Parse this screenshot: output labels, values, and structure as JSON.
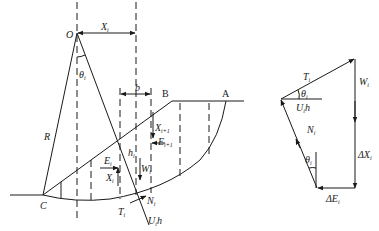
{
  "figure": {
    "left": {
      "points": {
        "O": "O",
        "A": "A",
        "B": "B",
        "C": "C"
      },
      "labels": {
        "R": "R",
        "Xi": "X",
        "Xi_sub": "i",
        "theta": "θ",
        "theta_sub": "i",
        "b": "b",
        "Ei": "E",
        "Ei_sub": "i",
        "XiSlice": "X",
        "XiSlice_sub": "i",
        "Xi1": "X",
        "Xi1_sub": "i+1",
        "Ei1": "E",
        "Ei1_sub": "i+1",
        "hi": "h",
        "hi_sub": "i",
        "W": "W",
        "W_sub": "i",
        "Ti": "T",
        "Ti_sub": "i",
        "Ni": "N",
        "Ni_sub": "i",
        "Uh": "U",
        "Uh_sub": "i",
        "Uh_tail": "h"
      }
    },
    "right": {
      "labels": {
        "Ti": "T",
        "Ti_sub": "i",
        "Wi": "W",
        "Wi_sub": "i",
        "theta": "θ",
        "theta_sub": "i",
        "Uh": "U",
        "Uh_sub": "i",
        "Uh_tail": "h",
        "Ni": "N",
        "Ni_sub": "i",
        "theta2": "θ",
        "theta2_sub": "i",
        "dXi": "ΔX",
        "dXi_sub": "i",
        "dEi": "ΔE",
        "dEi_sub": "i"
      }
    }
  }
}
